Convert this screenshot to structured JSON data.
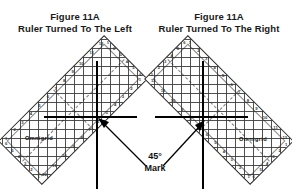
{
  "figure": {
    "left": {
      "title": "Figure 11A",
      "subtitle": "Ruler Turned To The Left",
      "brand": "Omnigrid",
      "ruler_rotation_deg": -45,
      "crosshair": {
        "x": 97,
        "y": 117
      },
      "arrow_name": "pointer-arrow-left"
    },
    "right": {
      "title": "Figure 11A",
      "subtitle": "Ruler Turned To The Right",
      "brand": "Omnigrid",
      "ruler_rotation_deg": 45,
      "crosshair": {
        "x": 203,
        "y": 117
      },
      "arrow_name": "pointer-arrow-right"
    }
  },
  "annotation": {
    "degree_line": "45°",
    "mark_line": "Mark"
  },
  "ruler_scale": {
    "top_numbers": [
      "1",
      "2",
      "3",
      "4",
      "5",
      "6",
      "7",
      "8",
      "9",
      "10",
      "11",
      "12"
    ],
    "bottom_numbers": [
      "12",
      "11",
      "10",
      "9",
      "8",
      "7",
      "6",
      "5",
      "4",
      "3",
      "2",
      "1"
    ],
    "left_numbers": [
      "6",
      "5",
      "4",
      "3",
      "2",
      "1"
    ],
    "right_numbers": [
      "1",
      "2",
      "3",
      "4",
      "5",
      "6"
    ]
  },
  "colors": {
    "background": "#ffffff",
    "text": "#1a1a1a",
    "crosshair": "#000000",
    "ruler_line": "#3c3c3c"
  }
}
